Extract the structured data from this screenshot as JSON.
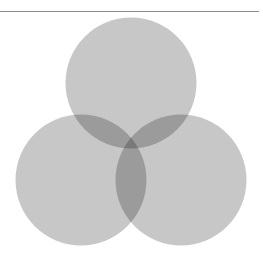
{
  "figure": {
    "background_color": "#ffffff",
    "width": 263,
    "height": 262
  },
  "separator": {
    "name": "horizontal-rule",
    "color": "#8c8c8c",
    "x1": 0,
    "x2": 259,
    "y": 11,
    "thickness": 1
  },
  "chart_data": {
    "type": "venn",
    "title": "",
    "subtitle": "",
    "xlabel": "",
    "ylabel": "",
    "grid": false,
    "legend": "none",
    "set_count": 3,
    "fill_color": "#000000",
    "fill_opacity": 0.22,
    "stroke": "none",
    "region_colors": {
      "single": "#c6c6c6",
      "double": "#b4b4b4",
      "triple": "#a3a3a3"
    },
    "circles": [
      {
        "id": "A",
        "label": "",
        "cx": 131,
        "cy": 83,
        "r": 65.5,
        "position": "top"
      },
      {
        "id": "B",
        "label": "",
        "cx": 81,
        "cy": 180,
        "r": 65.5,
        "position": "bottom-left"
      },
      {
        "id": "C",
        "label": "",
        "cx": 181,
        "cy": 180,
        "r": 65.5,
        "position": "bottom-right"
      }
    ],
    "region_labels": [],
    "annotations": []
  }
}
